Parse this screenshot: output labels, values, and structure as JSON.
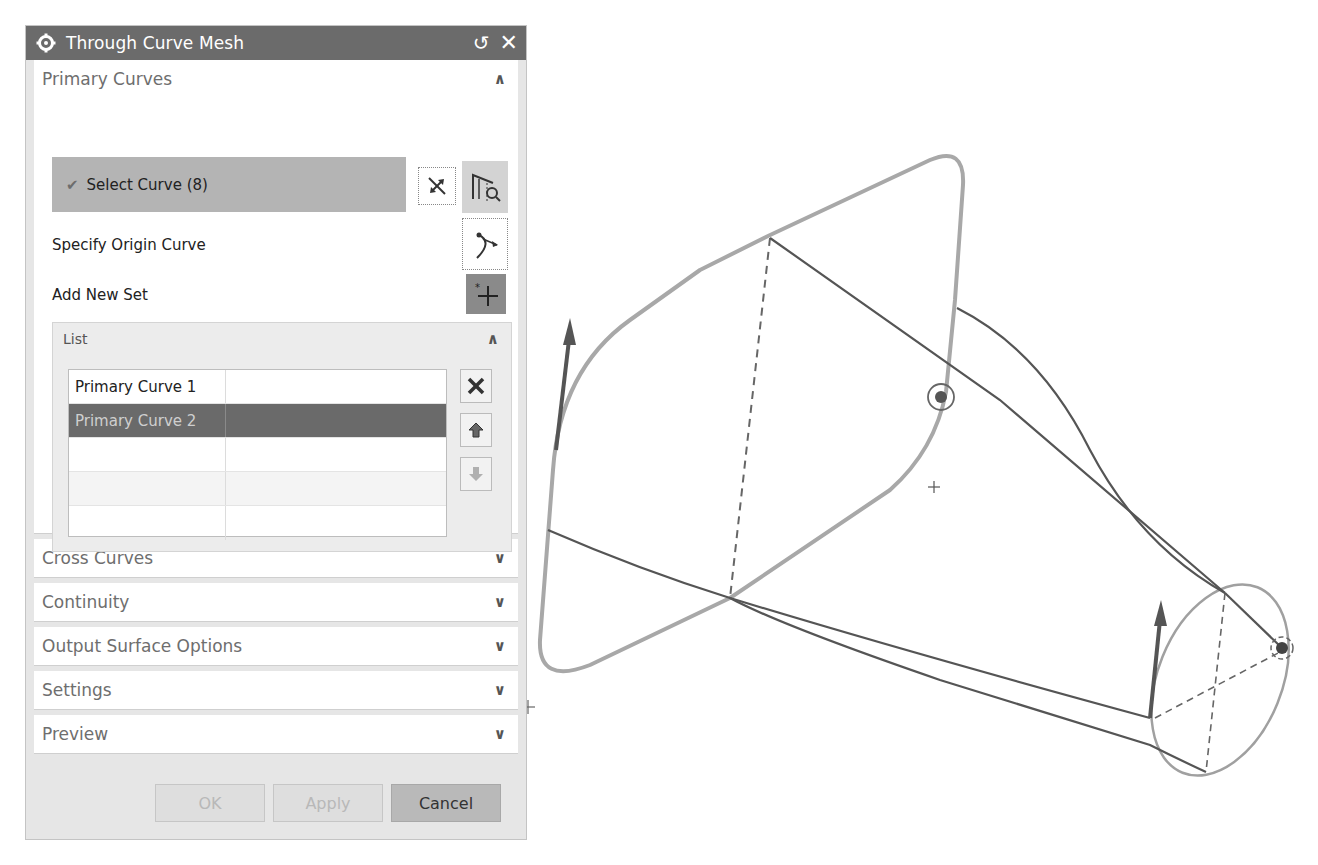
{
  "dialog": {
    "title": "Through Curve Mesh",
    "icons": {
      "title": "gear-icon",
      "reset": "reset-icon",
      "close": "close-icon"
    },
    "reset_glyph": "↺",
    "close_glyph": "✕"
  },
  "primary_curves": {
    "header": "Primary Curves",
    "expanded": true,
    "select_curve_label": "Select Curve (8)",
    "check_glyph": "✔",
    "specify_origin_label": "Specify Origin Curve",
    "add_new_set_label": "Add New Set",
    "list": {
      "header": "List",
      "rows": [
        {
          "name": "Primary Curve 1",
          "value": "",
          "selected": false
        },
        {
          "name": "Primary Curve 2",
          "value": "",
          "selected": true
        },
        {
          "name": "",
          "value": "",
          "selected": false
        },
        {
          "name": "",
          "value": "",
          "selected": false
        },
        {
          "name": "",
          "value": "",
          "selected": false
        }
      ],
      "tools": [
        "remove-icon",
        "move-up-icon",
        "move-down-icon"
      ]
    }
  },
  "collapsed_groups": [
    {
      "label": "Cross Curves"
    },
    {
      "label": "Continuity"
    },
    {
      "label": "Output Surface Options"
    },
    {
      "label": "Settings"
    },
    {
      "label": "Preview"
    }
  ],
  "chevrons": {
    "up": "∧",
    "down": "∨"
  },
  "buttons": {
    "ok": {
      "label": "OK",
      "enabled": false
    },
    "apply": {
      "label": "Apply",
      "enabled": false
    },
    "cancel": {
      "label": "Cancel",
      "enabled": true
    }
  },
  "colors": {
    "titlebar": "#6b6b6b",
    "selection_row": "#b4b4b4",
    "list_selected": "#6a6a6a",
    "primary_curve_stroke": "#a8a8a8",
    "cross_curve_stroke": "#555555"
  }
}
